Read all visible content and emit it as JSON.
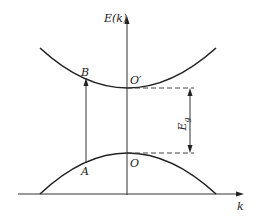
{
  "diagram": {
    "type": "band-structure",
    "axes": {
      "y_label": "E(k)",
      "x_label": "k"
    },
    "points": {
      "A": "A",
      "B": "B",
      "O": "O",
      "O_prime": "O′"
    },
    "gap_label_main": "E",
    "gap_label_sub": "g",
    "colors": {
      "line": "#222222",
      "background": "#ffffff"
    }
  }
}
